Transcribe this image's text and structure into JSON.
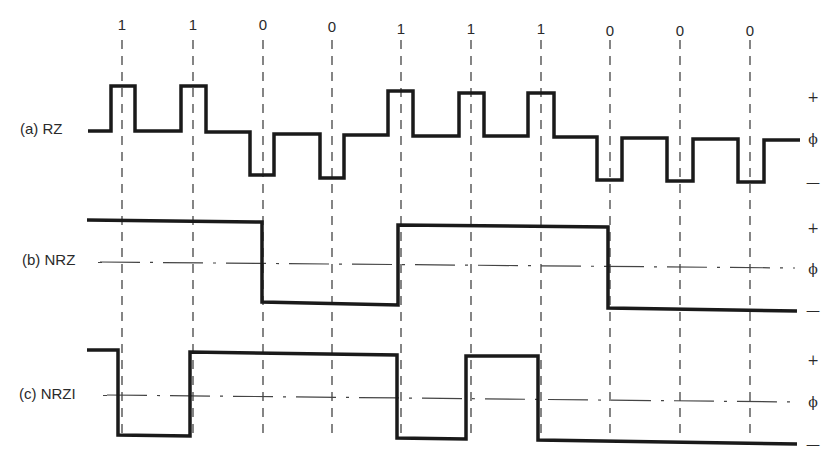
{
  "bits": [
    "1",
    "1",
    "0",
    "0",
    "1",
    "1",
    "1",
    "0",
    "0",
    "0"
  ],
  "bit_x": [
    122,
    193,
    263,
    332,
    401,
    471,
    541,
    610,
    680,
    750
  ],
  "signals": [
    {
      "id": "rz",
      "label": "(a) RZ",
      "levels": {
        "plus": "+",
        "zero": "ϕ",
        "minus": "—"
      }
    },
    {
      "id": "nrz",
      "label": "(b) NRZ",
      "levels": {
        "plus": "+",
        "zero": "ϕ",
        "minus": "—"
      }
    },
    {
      "id": "nrzi",
      "label": "(c) NRZI",
      "levels": {
        "plus": "+",
        "zero": "ϕ",
        "minus": "—"
      }
    }
  ],
  "colors": {
    "waveform": "#1a1a1a",
    "guide": "#444444"
  }
}
